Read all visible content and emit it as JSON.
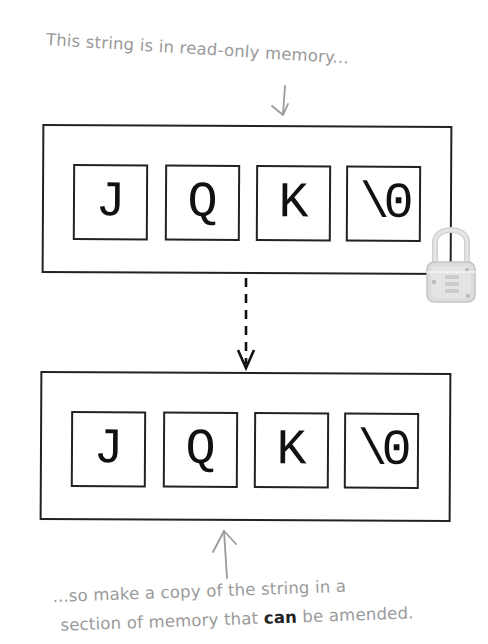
{
  "annotations": {
    "top": "This string is in read-only memory...",
    "bottom_line1": "...so make a copy of the string in a",
    "bottom_line2_before": "section of memory that ",
    "bottom_line2_emphasis": "can",
    "bottom_line2_after": " be amended."
  },
  "original_string": {
    "label": "read-only string",
    "locked": true,
    "cells": [
      "J",
      "Q",
      "K",
      "\\0"
    ]
  },
  "copied_string": {
    "label": "amendable copy",
    "locked": false,
    "cells": [
      "J",
      "Q",
      "K",
      "\\0"
    ]
  },
  "icons": {
    "lock": "padlock-icon",
    "copy_arrow": "dashed-down-arrow",
    "annotation_arrow_down": "hand-drawn-down-arrow",
    "annotation_arrow_up": "hand-drawn-up-arrow"
  },
  "colors": {
    "annotation_text": "#9a9a9a",
    "box_border": "#222222",
    "glyph": "#111111",
    "lock": "#cfcfcf"
  }
}
